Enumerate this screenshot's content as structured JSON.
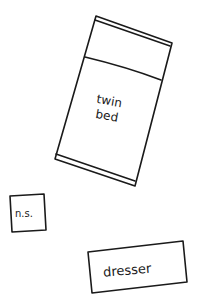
{
  "diagram": {
    "type": "room-layout-sketch",
    "background": "#ffffff",
    "ink_color": "#1a1a1a",
    "items": [
      {
        "id": "twin-bed",
        "label_line1": "twin",
        "label_line2": "bed"
      },
      {
        "id": "nightstand",
        "label": "n.s."
      },
      {
        "id": "dresser",
        "label": "dresser"
      }
    ]
  }
}
